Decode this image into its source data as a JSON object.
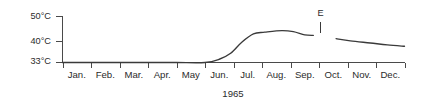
{
  "chart_data": {
    "type": "line",
    "title": "",
    "subtitle": "",
    "xlabel": "1965",
    "ylabel": "",
    "grid": false,
    "legend": false,
    "categories": [
      "Jan.",
      "Feb.",
      "Mar.",
      "Apr.",
      "May",
      "Jun.",
      "Jul.",
      "Aug.",
      "Sep.",
      "Oct.",
      "Nov.",
      "Dec."
    ],
    "ytick_labels": [
      "50°C",
      "40°C",
      "33°C"
    ],
    "ytick_values": [
      50,
      40,
      33
    ],
    "ylim": [
      33,
      52
    ],
    "xlim": [
      0,
      12
    ],
    "units": "°C",
    "series": [
      {
        "name": "segment-1",
        "points": [
          {
            "x": "Jan.",
            "month_index": 0.0,
            "value": 33.0
          },
          {
            "x": "Feb.",
            "month_index": 1.0,
            "value": 33.0
          },
          {
            "x": "Mar.",
            "month_index": 2.0,
            "value": 33.0
          },
          {
            "x": "Apr.",
            "month_index": 3.0,
            "value": 33.0
          },
          {
            "x": "May",
            "month_index": 4.0,
            "value": 33.0
          },
          {
            "x": "Jun.",
            "month_index": 5.0,
            "value": 33.0
          },
          {
            "x": "Jun.-mid",
            "month_index": 5.5,
            "value": 34.2
          },
          {
            "x": "Jun.-late",
            "month_index": 5.9,
            "value": 36.4
          },
          {
            "x": "Jul.-early",
            "month_index": 6.3,
            "value": 40.6
          },
          {
            "x": "Jul.",
            "month_index": 6.7,
            "value": 43.6
          },
          {
            "x": "Jul.-late",
            "month_index": 7.1,
            "value": 44.2
          },
          {
            "x": "Aug.",
            "month_index": 7.7,
            "value": 44.8
          },
          {
            "x": "Aug.-late",
            "month_index": 8.1,
            "value": 44.4
          },
          {
            "x": "Sep.-early",
            "month_index": 8.5,
            "value": 43.2
          },
          {
            "x": "Sep.",
            "month_index": 8.8,
            "value": 43.0
          }
        ]
      },
      {
        "name": "segment-2",
        "points": [
          {
            "x": "Oct.-early",
            "month_index": 9.6,
            "value": 41.8
          },
          {
            "x": "Oct.",
            "month_index": 10.1,
            "value": 41.0
          },
          {
            "x": "Nov.",
            "month_index": 10.8,
            "value": 40.2
          },
          {
            "x": "Nov.-late",
            "month_index": 11.4,
            "value": 39.5
          },
          {
            "x": "Dec.",
            "month_index": 12.0,
            "value": 39.0
          }
        ]
      }
    ],
    "annotations": [
      {
        "label": "E",
        "name": "event-marker-e",
        "month_index": 9.05,
        "value_top": 48.0,
        "value_bottom": 44.0
      }
    ]
  }
}
